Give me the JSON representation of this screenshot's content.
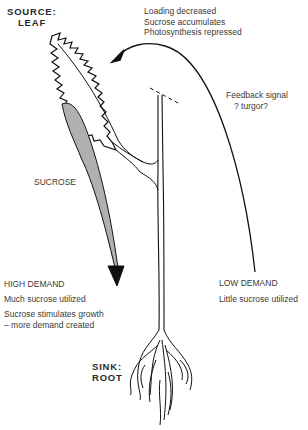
{
  "diagram": {
    "type": "plant source-sink sucrose transport diagram",
    "source": {
      "line1": "SOURCE:",
      "line2": "LEAF"
    },
    "sink": {
      "line1": "SINK:",
      "line2": "ROOT"
    },
    "leaf_notes": [
      "Loading decreased",
      "Sucrose accumulates",
      "Photosynthesis repressed"
    ],
    "feedback": {
      "line1": "Feedback signal",
      "line2": "? turgor?"
    },
    "flow_label": "SUCROSE",
    "high_demand": {
      "title": "HIGH DEMAND",
      "note1": "Much sucrose utilized",
      "note2a": "Sucrose stimulates growth",
      "note2b": "– more demand created"
    },
    "low_demand": {
      "title": "LOW DEMAND",
      "note1": "Little sucrose utilized"
    },
    "colors": {
      "arrow_fill": "#b0b0b0",
      "line": "#111111",
      "text": "#3a3a3a"
    }
  }
}
